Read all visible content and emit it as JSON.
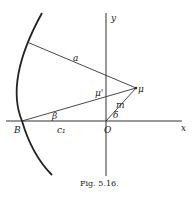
{
  "figure": {
    "caption": "Fig. 5.16.",
    "labels": {
      "y_axis": "y",
      "x_axis": "x",
      "origin": "O",
      "point_B": "B",
      "point_mu": "μ",
      "mu_prime": "μ'",
      "line_a": "a",
      "line_beta": "β",
      "segment_c1": "c₁",
      "line_m": "m",
      "angle_delta": "δ"
    },
    "colors": {
      "stroke": "#333333",
      "background": "#ffffff"
    }
  }
}
